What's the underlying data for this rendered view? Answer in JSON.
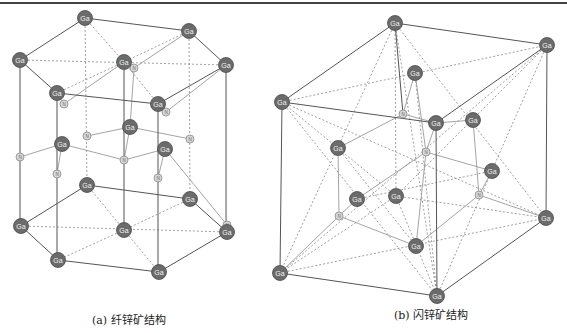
{
  "figure": {
    "panels": [
      {
        "id": "a",
        "caption": "(a) 纤锌矿结构",
        "structure": "wurtzite",
        "atoms": {
          "Ga": [
            [
              85,
              18
            ],
            [
              189,
              31
            ],
            [
              20,
              60
            ],
            [
              124,
              62
            ],
            [
              226,
              65
            ],
            [
              57,
              93
            ],
            [
              158,
              104
            ],
            [
              130,
              127
            ],
            [
              62,
              144
            ],
            [
              165,
              149
            ],
            [
              87,
              185
            ],
            [
              190,
              199
            ],
            [
              21,
              226
            ],
            [
              124,
              230
            ],
            [
              227,
              232
            ],
            [
              58,
              260
            ],
            [
              159,
              272
            ]
          ],
          "N": [
            [
              134,
              68
            ],
            [
              64,
              104
            ],
            [
              166,
              112
            ],
            [
              87,
              136
            ],
            [
              190,
              139
            ],
            [
              20,
              157
            ],
            [
              124,
              160
            ],
            [
              227,
              225
            ],
            [
              57,
              174
            ],
            [
              158,
              178
            ]
          ]
        },
        "solid_bonds": [
          [
            [
              85,
              18
            ],
            [
              189,
              31
            ]
          ],
          [
            [
              85,
              18
            ],
            [
              20,
              60
            ]
          ],
          [
            [
              189,
              31
            ],
            [
              226,
              65
            ]
          ],
          [
            [
              20,
              60
            ],
            [
              57,
              93
            ]
          ],
          [
            [
              57,
              93
            ],
            [
              158,
              104
            ]
          ],
          [
            [
              158,
              104
            ],
            [
              226,
              65
            ]
          ],
          [
            [
              20,
              60
            ],
            [
              20,
              226
            ]
          ],
          [
            [
              57,
              93
            ],
            [
              57,
              260
            ]
          ],
          [
            [
              158,
              104
            ],
            [
              158,
              272
            ]
          ],
          [
            [
              226,
              65
            ],
            [
              226,
              232
            ]
          ],
          [
            [
              124,
              62
            ],
            [
              124,
              230
            ]
          ],
          [
            [
              87,
              185
            ],
            [
              190,
              199
            ]
          ],
          [
            [
              87,
              185
            ],
            [
              21,
              226
            ]
          ],
          [
            [
              190,
              199
            ],
            [
              227,
              232
            ]
          ],
          [
            [
              21,
              226
            ],
            [
              58,
              260
            ]
          ],
          [
            [
              58,
              260
            ],
            [
              159,
              272
            ]
          ],
          [
            [
              159,
              272
            ],
            [
              227,
              232
            ]
          ]
        ],
        "light_bonds": [
          [
            [
              130,
              127
            ],
            [
              87,
              136
            ]
          ],
          [
            [
              130,
              127
            ],
            [
              190,
              139
            ]
          ],
          [
            [
              62,
              144
            ],
            [
              20,
              157
            ]
          ],
          [
            [
              62,
              144
            ],
            [
              124,
              160
            ]
          ],
          [
            [
              165,
              149
            ],
            [
              124,
              160
            ]
          ],
          [
            [
              165,
              149
            ],
            [
              227,
              225
            ]
          ],
          [
            [
              62,
              144
            ],
            [
              57,
              174
            ]
          ],
          [
            [
              165,
              149
            ],
            [
              158,
              178
            ]
          ],
          [
            [
              124,
              62
            ],
            [
              134,
              68
            ]
          ],
          [
            [
              57,
              93
            ],
            [
              64,
              104
            ]
          ],
          [
            [
              158,
              104
            ],
            [
              166,
              112
            ]
          ],
          [
            [
              134,
              68
            ],
            [
              189,
              31
            ]
          ],
          [
            [
              64,
              104
            ],
            [
              124,
              62
            ]
          ],
          [
            [
              166,
              112
            ],
            [
              226,
              65
            ]
          ],
          [
            [
              124,
              160
            ],
            [
              130,
              127
            ]
          ],
          [
            [
              130,
              127
            ],
            [
              134,
              68
            ]
          ]
        ],
        "dashed_bonds": [
          [
            [
              20,
              60
            ],
            [
              226,
              65
            ]
          ],
          [
            [
              85,
              18
            ],
            [
              124,
              62
            ]
          ],
          [
            [
              124,
              62
            ],
            [
              158,
              104
            ]
          ],
          [
            [
              124,
              62
            ],
            [
              57,
              93
            ]
          ],
          [
            [
              189,
              31
            ],
            [
              124,
              62
            ]
          ],
          [
            [
              85,
              18
            ],
            [
              87,
              185
            ]
          ],
          [
            [
              189,
              31
            ],
            [
              190,
              199
            ]
          ],
          [
            [
              21,
              226
            ],
            [
              227,
              232
            ]
          ],
          [
            [
              87,
              185
            ],
            [
              124,
              230
            ]
          ],
          [
            [
              124,
              230
            ],
            [
              159,
              272
            ]
          ],
          [
            [
              124,
              230
            ],
            [
              58,
              260
            ]
          ],
          [
            [
              190,
              199
            ],
            [
              124,
              230
            ]
          ]
        ]
      },
      {
        "id": "b",
        "caption": "(b) 闪锌矿结构",
        "structure": "zinc blende",
        "atoms": {
          "Ga": [
            [
              395,
              23
            ],
            [
              547,
              45
            ],
            [
              282,
              102
            ],
            [
              415,
              73
            ],
            [
              436,
              123
            ],
            [
              473,
              120
            ],
            [
              338,
              148
            ],
            [
              492,
              171
            ],
            [
              357,
              199
            ],
            [
              396,
              196
            ],
            [
              416,
              246
            ],
            [
              546,
              218
            ],
            [
              280,
              273
            ],
            [
              437,
              296
            ]
          ],
          "N": [
            [
              403,
              114
            ],
            [
              426,
              152
            ],
            [
              479,
              195
            ],
            [
              339,
              216
            ]
          ]
        },
        "solid_bonds": [
          [
            [
              395,
              23
            ],
            [
              547,
              45
            ]
          ],
          [
            [
              395,
              23
            ],
            [
              282,
              102
            ]
          ],
          [
            [
              282,
              102
            ],
            [
              436,
              123
            ]
          ],
          [
            [
              436,
              123
            ],
            [
              547,
              45
            ]
          ],
          [
            [
              282,
              102
            ],
            [
              280,
              273
            ]
          ],
          [
            [
              547,
              45
            ],
            [
              546,
              218
            ]
          ],
          [
            [
              280,
              273
            ],
            [
              437,
              296
            ]
          ],
          [
            [
              437,
              296
            ],
            [
              546,
              218
            ]
          ],
          [
            [
              436,
              123
            ],
            [
              437,
              296
            ]
          ],
          [
            [
              395,
              23
            ],
            [
              403,
              114
            ]
          ]
        ],
        "light_bonds": [
          [
            [
              403,
              114
            ],
            [
              415,
              73
            ]
          ],
          [
            [
              403,
              114
            ],
            [
              436,
              123
            ]
          ],
          [
            [
              403,
              114
            ],
            [
              338,
              148
            ]
          ],
          [
            [
              426,
              152
            ],
            [
              436,
              123
            ]
          ],
          [
            [
              426,
              152
            ],
            [
              492,
              171
            ]
          ],
          [
            [
              426,
              152
            ],
            [
              357,
              199
            ]
          ],
          [
            [
              426,
              152
            ],
            [
              416,
              246
            ]
          ],
          [
            [
              479,
              195
            ],
            [
              492,
              171
            ]
          ],
          [
            [
              479,
              195
            ],
            [
              473,
              120
            ]
          ],
          [
            [
              479,
              195
            ],
            [
              546,
              218
            ]
          ],
          [
            [
              479,
              195
            ],
            [
              416,
              246
            ]
          ],
          [
            [
              339,
              216
            ],
            [
              357,
              199
            ]
          ],
          [
            [
              339,
              216
            ],
            [
              338,
              148
            ]
          ],
          [
            [
              339,
              216
            ],
            [
              280,
              273
            ]
          ],
          [
            [
              339,
              216
            ],
            [
              416,
              246
            ]
          ],
          [
            [
              436,
              123
            ],
            [
              473,
              120
            ]
          ],
          [
            [
              415,
              73
            ],
            [
              426,
              152
            ]
          ]
        ],
        "dashed_bonds": [
          [
            [
              282,
              102
            ],
            [
              547,
              45
            ]
          ],
          [
            [
              395,
              23
            ],
            [
              437,
              296
            ]
          ],
          [
            [
              395,
              23
            ],
            [
              280,
              273
            ]
          ],
          [
            [
              395,
              23
            ],
            [
              546,
              218
            ]
          ],
          [
            [
              547,
              45
            ],
            [
              280,
              273
            ]
          ],
          [
            [
              547,
              45
            ],
            [
              437,
              296
            ]
          ],
          [
            [
              282,
              102
            ],
            [
              546,
              218
            ]
          ],
          [
            [
              282,
              102
            ],
            [
              437,
              296
            ]
          ],
          [
            [
              280,
              273
            ],
            [
              546,
              218
            ]
          ],
          [
            [
              396,
              196
            ],
            [
              282,
              102
            ]
          ],
          [
            [
              396,
              196
            ],
            [
              547,
              45
            ]
          ],
          [
            [
              396,
              196
            ],
            [
              280,
              273
            ]
          ],
          [
            [
              396,
              196
            ],
            [
              546,
              218
            ]
          ],
          [
            [
              396,
              196
            ],
            [
              437,
              296
            ]
          ],
          [
            [
              396,
              196
            ],
            [
              395,
              23
            ]
          ],
          [
            [
              338,
              148
            ],
            [
              416,
              246
            ]
          ],
          [
            [
              357,
              199
            ],
            [
              492,
              171
            ]
          ],
          [
            [
              415,
              73
            ],
            [
              437,
              296
            ]
          ]
        ]
      }
    ],
    "labels": {
      "large_atom": "Ga",
      "small_atom": "N"
    },
    "colors": {
      "ga_fill": "#6b6b6b",
      "ga_stroke": "#4a4a4a",
      "ga_text": "#f2f2f2",
      "n_fill": "#d8d8d8",
      "n_stroke": "#8a8a8a",
      "n_text": "#666666",
      "solid_bond": "#555555",
      "light_bond": "#9a9a9a",
      "dashed_bond": "#777777"
    }
  }
}
